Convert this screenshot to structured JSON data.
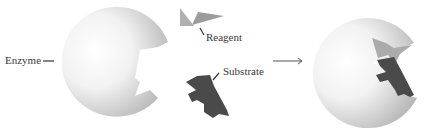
{
  "diagram": {
    "labels": {
      "enzyme": "Enzyme",
      "reagent": "Reagent",
      "substrate": "Substrate"
    },
    "colors": {
      "enzyme_light": "#ffffff",
      "enzyme_dark": "#b8b8b8",
      "reagent": "#a9a9a9",
      "substrate": "#4a4a4a",
      "leader_line": "#333333",
      "arrow": "#555555"
    },
    "arrow": "reaction-arrow"
  }
}
